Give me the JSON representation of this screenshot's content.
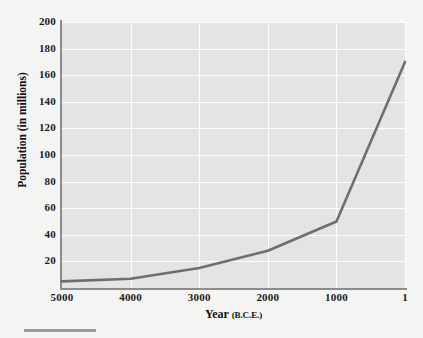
{
  "chart_data": {
    "type": "line",
    "title": "",
    "xlabel": "Year (B.C.E.)",
    "xlabel_main": "Year",
    "xlabel_sub": "(B.C.E.)",
    "ylabel": "Population (in millions)",
    "x": [
      5000,
      4000,
      3000,
      2000,
      1000,
      1
    ],
    "values": [
      5,
      7,
      15,
      28,
      50,
      170
    ],
    "series": [
      {
        "name": "World population",
        "values": [
          5,
          7,
          15,
          28,
          50,
          170
        ]
      }
    ],
    "xticks": [
      "5000",
      "4000",
      "3000",
      "2000",
      "1000",
      "1"
    ],
    "xtick_values": [
      5000,
      4000,
      3000,
      2000,
      1000,
      1
    ],
    "yticks": [
      "20",
      "40",
      "60",
      "80",
      "100",
      "120",
      "140",
      "160",
      "180",
      "200"
    ],
    "ytick_values": [
      20,
      40,
      60,
      80,
      100,
      120,
      140,
      160,
      180,
      200
    ],
    "xlim": [
      5000,
      1
    ],
    "ylim": [
      0,
      200
    ],
    "x_axis_reversed": true,
    "grid": true,
    "legend": "none",
    "line_color": "#6e6e6e",
    "plot_background": "#e4e4e4",
    "gridline_color": "#fdfdfd",
    "axis_color": "#8c8c8c",
    "page_background": "#f4f4f2"
  }
}
